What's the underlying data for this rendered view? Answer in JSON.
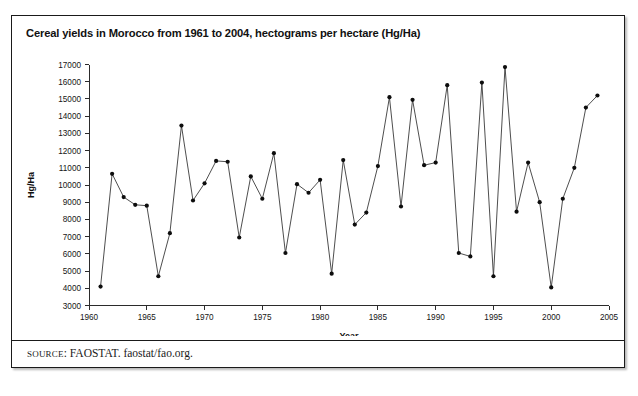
{
  "figure": {
    "title": "Cereal yields in Morocco from 1961 to 2004, hectograms per hectare (Hg/Ha)",
    "source_prefix": "SOURCE",
    "source_text": ": FAOSTAT. faostat/fao.org."
  },
  "chart_data": {
    "type": "line",
    "title": "Cereal yields in Morocco from 1961 to 2004, hectograms per hectare (Hg/Ha)",
    "xlabel": "Year",
    "ylabel": "Hg/Ha",
    "xlim": [
      1960,
      2005
    ],
    "ylim": [
      3000,
      17000
    ],
    "xticks": [
      1960,
      1965,
      1970,
      1975,
      1980,
      1985,
      1990,
      1995,
      2000,
      2005
    ],
    "yticks": [
      3000,
      4000,
      5000,
      6000,
      7000,
      8000,
      9000,
      10000,
      11000,
      12000,
      13000,
      14000,
      15000,
      16000,
      17000
    ],
    "grid": false,
    "legend": "none",
    "marker": "filled-circle",
    "line_color": "#3a3a3a",
    "marker_color": "#0d0d0d",
    "x": [
      1961,
      1962,
      1963,
      1964,
      1965,
      1966,
      1967,
      1968,
      1969,
      1970,
      1971,
      1972,
      1973,
      1974,
      1975,
      1976,
      1977,
      1978,
      1979,
      1980,
      1981,
      1982,
      1983,
      1984,
      1985,
      1986,
      1987,
      1988,
      1989,
      1990,
      1991,
      1992,
      1993,
      1994,
      1995,
      1996,
      1997,
      1998,
      1999,
      2000,
      2001,
      2002,
      2003,
      2004
    ],
    "values": [
      4100,
      10650,
      9300,
      8850,
      8800,
      4700,
      7200,
      13450,
      9100,
      10100,
      11400,
      11350,
      6950,
      10500,
      9200,
      11850,
      6050,
      10050,
      9550,
      10300,
      4850,
      11450,
      7700,
      8400,
      11100,
      15100,
      8750,
      14950,
      11150,
      11300,
      15800,
      6050,
      5850,
      15950,
      4700,
      16850,
      8450,
      11300,
      9000,
      4050,
      9200,
      11000,
      14500,
      15200
    ]
  }
}
